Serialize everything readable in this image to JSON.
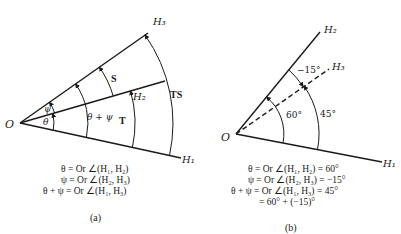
{
  "diagram_a": {
    "origin_label": "O",
    "rays": {
      "h1": "H₁",
      "h2": "H₂",
      "h3": "H₃"
    },
    "angle_labels": {
      "theta": "θ",
      "psi": "ψ",
      "theta_plus_psi": "θ + ψ",
      "s": "S",
      "t": "T",
      "ts": "TS"
    },
    "equations": [
      "θ = Or ∠(H₁, H₂)",
      "ψ = Or ∠(H₂, H₃)",
      "θ + ψ = Or ∠(H₁, H₃)"
    ],
    "caption": "(a)"
  },
  "diagram_b": {
    "origin_label": "O",
    "rays": {
      "h1": "H₁",
      "h2": "H₂",
      "h3": "H₃"
    },
    "angle_labels": {
      "a60": "60°",
      "a45": "45°",
      "neg15": "−15°"
    },
    "equations": [
      "θ = Or ∠(H₁, H₂) = 60°",
      "ψ = Or ∠(H₂, H₃) = −15°",
      "θ + ψ = Or ∠(H₁, H₃) = 45°",
      "= 60° + (−15)°"
    ],
    "caption": "(b)"
  }
}
